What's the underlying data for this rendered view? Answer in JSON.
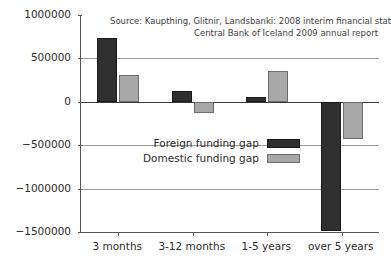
{
  "chart_data": {
    "type": "bar",
    "title": "",
    "subtitle": "",
    "xlabel": "",
    "ylabel": "",
    "categories": [
      "3 months",
      "3-12 months",
      "1-5 years",
      "over 5 years"
    ],
    "series": [
      {
        "name": "Foreign funding gap",
        "color": "#2f2f2f",
        "values": [
          730000,
          130000,
          55000,
          -1490000
        ]
      },
      {
        "name": "Domestic funding gap",
        "color": "#a8a8a8",
        "values": [
          310000,
          -125000,
          355000,
          -430000
        ]
      }
    ],
    "ylim": [
      -1500000,
      1000000
    ],
    "yticks": [
      1000000,
      500000,
      0,
      -500000,
      -1000000,
      -1500000
    ],
    "ytick_labels": [
      "1000000",
      "500000",
      "0",
      "−1500000",
      "−1000000",
      "−500000"
    ],
    "grid": true,
    "legend_position": "center",
    "annotations": [
      "Source: Kaupthing, Glitnir, Landsbanki: 2008 interim financial statements;",
      "Central Bank of Iceland 2009 annual report"
    ]
  },
  "axis": {
    "y_ticks": [
      {
        "value": 1000000,
        "label": "1000000"
      },
      {
        "value": 500000,
        "label": "500000"
      },
      {
        "value": 0,
        "label": "0"
      },
      {
        "value": -500000,
        "label": "−500000"
      },
      {
        "value": -1000000,
        "label": "−1000000"
      },
      {
        "value": -1500000,
        "label": "−1500000"
      }
    ],
    "x_ticks": [
      {
        "label": "3 months"
      },
      {
        "label": "3-12 months"
      },
      {
        "label": "1-5 years"
      },
      {
        "label": "over 5 years"
      }
    ]
  },
  "source_note": {
    "line1": "Source: Kaupthing, Glitnir, Landsbanki: 2008 interim financial statements;",
    "line2": "Central Bank of Iceland 2009 annual report"
  },
  "legend": {
    "items": [
      {
        "label": "Foreign funding gap",
        "swatch": "foreign"
      },
      {
        "label": "Domestic funding gap",
        "swatch": "domestic"
      }
    ]
  },
  "colors": {
    "foreign": "#2f2f2f",
    "domestic": "#a8a8a8",
    "gridline": "#9a9a9a",
    "axis": "#555555",
    "background": "#ffffff"
  }
}
